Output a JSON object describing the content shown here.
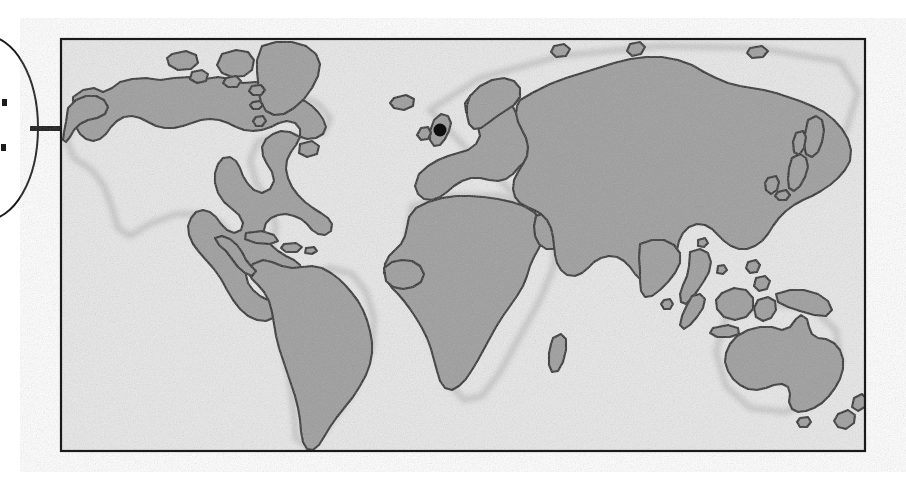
{
  "figure": {
    "kind": "world-map-locator-figure",
    "background_color": "#ffffff",
    "width": 906,
    "height": 484
  },
  "map_frame": {
    "name": "world-map-panel",
    "x": 60,
    "y": 38,
    "width": 806,
    "height": 414,
    "border_color": "#1a1a1a",
    "border_width": 2,
    "ocean_color": "#ececec",
    "land_color": "#9d9d9d",
    "coastline_color": "#262626",
    "projection": "equirectangular-world"
  },
  "callout": {
    "name": "callout-ellipse",
    "shape": "ellipse",
    "cx": -14,
    "cy": 128,
    "rx": 52,
    "ry": 92,
    "stroke_color": "#1a1a1a",
    "stroke_width": 2,
    "fill_color": "#ffffff",
    "clipped_at_left_edge": true,
    "fragment_marks": [
      {
        "x": 2,
        "y": 99,
        "w": 5,
        "h": 7
      },
      {
        "x": 1,
        "y": 144,
        "w": 5,
        "h": 7
      }
    ]
  },
  "leader_line": {
    "name": "callout-leader-line",
    "x1": 30,
    "y1": 128,
    "x2": 62,
    "y2": 128,
    "color": "#141414",
    "thickness": 5
  },
  "location_marker": {
    "name": "location-marker-dot",
    "cx": 440,
    "cy": 130,
    "r": 6.5,
    "color": "#101010",
    "region": "great-britain"
  },
  "landmasses": [
    {
      "name": "north-america"
    },
    {
      "name": "greenland"
    },
    {
      "name": "south-america"
    },
    {
      "name": "europe"
    },
    {
      "name": "africa"
    },
    {
      "name": "madagascar"
    },
    {
      "name": "asia"
    },
    {
      "name": "india"
    },
    {
      "name": "japan"
    },
    {
      "name": "indonesia"
    },
    {
      "name": "philippines"
    },
    {
      "name": "new-guinea"
    },
    {
      "name": "australia"
    },
    {
      "name": "new-zealand"
    },
    {
      "name": "iceland"
    },
    {
      "name": "great-britain"
    },
    {
      "name": "ireland"
    },
    {
      "name": "caribbean-islands"
    },
    {
      "name": "arctic-islands"
    }
  ]
}
